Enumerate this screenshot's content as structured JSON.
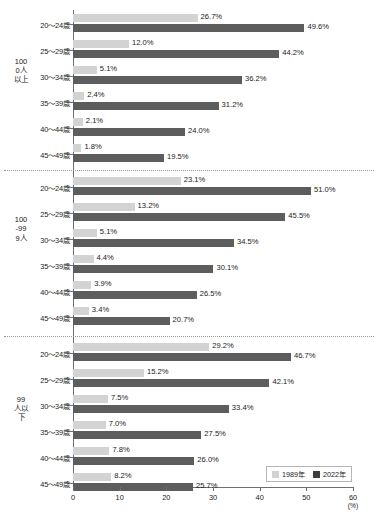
{
  "chart_data": {
    "type": "bar",
    "title": "",
    "xlabel": "(%)",
    "ylabel": "",
    "xlim": [
      0,
      60
    ],
    "xticks": [
      0,
      10,
      20,
      30,
      40,
      50,
      60
    ],
    "grid": false,
    "legend_position": "bottom-right",
    "orientation": "horizontal",
    "categories": [
      "20～24歳",
      "25～29歳",
      "30～34歳",
      "35～39歳",
      "40～44歳",
      "45～49歳"
    ],
    "series": [
      {
        "name": "1989年",
        "color": "#d3d3d3"
      },
      {
        "name": "2022年",
        "color": "#5d5d5d"
      }
    ],
    "groups": [
      {
        "label": "1000人以上",
        "rows": [
          {
            "category": "20～24歳",
            "old": 26.7,
            "new": 49.6,
            "old_label": "26.7%",
            "new_label": "49.6%"
          },
          {
            "category": "25～29歳",
            "old": 12.0,
            "new": 44.2,
            "old_label": "12.0%",
            "new_label": "44.2%"
          },
          {
            "category": "30～34歳",
            "old": 5.1,
            "new": 36.2,
            "old_label": "5.1%",
            "new_label": "36.2%"
          },
          {
            "category": "35～39歳",
            "old": 2.4,
            "new": 31.2,
            "old_label": "2.4%",
            "new_label": "31.2%"
          },
          {
            "category": "40～44歳",
            "old": 2.1,
            "new": 24.0,
            "old_label": "2.1%",
            "new_label": "24.0%"
          },
          {
            "category": "45～49歳",
            "old": 1.8,
            "new": 19.5,
            "old_label": "1.8%",
            "new_label": "19.5%"
          }
        ]
      },
      {
        "label": "100-999人",
        "rows": [
          {
            "category": "20～24歳",
            "old": 23.1,
            "new": 51.0,
            "old_label": "23.1%",
            "new_label": "51.0%"
          },
          {
            "category": "25～29歳",
            "old": 13.2,
            "new": 45.5,
            "old_label": "13.2%",
            "new_label": "45.5%"
          },
          {
            "category": "30～34歳",
            "old": 5.1,
            "new": 34.5,
            "old_label": "5.1%",
            "new_label": "34.5%"
          },
          {
            "category": "35～39歳",
            "old": 4.4,
            "new": 30.1,
            "old_label": "4.4%",
            "new_label": "30.1%"
          },
          {
            "category": "40～44歳",
            "old": 3.9,
            "new": 26.5,
            "old_label": "3.9%",
            "new_label": "26.5%"
          },
          {
            "category": "45～49歳",
            "old": 3.4,
            "new": 20.7,
            "old_label": "3.4%",
            "new_label": "20.7%"
          }
        ]
      },
      {
        "label": "99人以下",
        "rows": [
          {
            "category": "20～24歳",
            "old": 29.2,
            "new": 46.7,
            "old_label": "29.2%",
            "new_label": "46.7%"
          },
          {
            "category": "25～29歳",
            "old": 15.2,
            "new": 42.1,
            "old_label": "15.2%",
            "new_label": "42.1%"
          },
          {
            "category": "30～34歳",
            "old": 7.5,
            "new": 33.4,
            "old_label": "7.5%",
            "new_label": "33.4%"
          },
          {
            "category": "35～39歳",
            "old": 7.0,
            "new": 27.5,
            "old_label": "7.0%",
            "new_label": "27.5%"
          },
          {
            "category": "40～44歳",
            "old": 7.8,
            "new": 26.0,
            "old_label": "7.8%",
            "new_label": "26.0%"
          },
          {
            "category": "45～49歳",
            "old": 8.2,
            "new": 25.7,
            "old_label": "8.2%",
            "new_label": "25.7%"
          }
        ]
      }
    ]
  },
  "legend": {
    "items": [
      {
        "label": "1989年",
        "swatch": "old"
      },
      {
        "label": "2022年",
        "swatch": "new"
      }
    ]
  },
  "axis": {
    "unit": "(%)",
    "tick_labels": [
      "0",
      "10",
      "20",
      "30",
      "40",
      "50",
      "60"
    ]
  }
}
